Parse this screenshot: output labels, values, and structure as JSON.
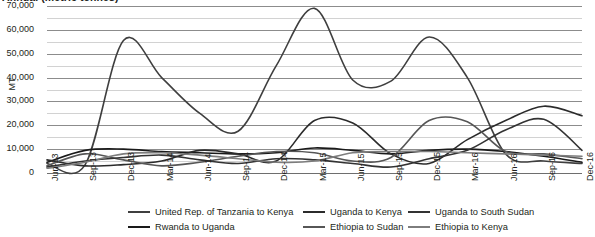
{
  "chart_data": {
    "type": "line",
    "title": "Annual (metric tonnes)",
    "xlabel": "",
    "ylabel": "MT",
    "ylim": [
      0,
      70000
    ],
    "ytick_labels": [
      "0",
      "10,000",
      "20,000",
      "30,000",
      "40,000",
      "50,000",
      "60,000",
      "70,000"
    ],
    "ytick_values": [
      0,
      10000,
      20000,
      30000,
      40000,
      50000,
      60000,
      70000
    ],
    "grid": "horizontal major and minor (5,000 step)",
    "legend_position": "bottom",
    "categories": [
      "Jun-13",
      "Sep-13",
      "Dec-13",
      "Mar-14",
      "Jun-14",
      "Sep-14",
      "Dec-14",
      "Mar-15",
      "Jun-15",
      "Sep-15",
      "Dec-15",
      "Mar-16",
      "Jun-16",
      "Sep-16",
      "Dec-16"
    ],
    "series": [
      {
        "name": "United Rep. of Tanzania to Kenya",
        "color": "#3f3f3f",
        "values": [
          4000,
          3500,
          55500,
          40000,
          25000,
          17500,
          45000,
          69000,
          39000,
          38500,
          57000,
          40000,
          8000,
          5000,
          4000
        ]
      },
      {
        "name": "Rwanda to Uganda",
        "color": "#1a1a1a",
        "values": [
          4500,
          9500,
          10000,
          9000,
          8500,
          8000,
          8500,
          10500,
          9500,
          8000,
          9500,
          10000,
          9000,
          7000,
          4500
        ]
      },
      {
        "name": "Uganda to Kenya",
        "color": "#2b2b2b",
        "values": [
          5500,
          3000,
          3500,
          5000,
          9500,
          8000,
          5000,
          22000,
          21000,
          8000,
          4000,
          14000,
          22000,
          28000,
          24000
        ]
      },
      {
        "name": "Ethiopia to Sudan",
        "color": "#565656",
        "values": [
          3000,
          8000,
          5500,
          3000,
          4500,
          7000,
          9000,
          8500,
          5000,
          6500,
          22000,
          21500,
          9000,
          8000,
          6000
        ]
      },
      {
        "name": "Uganda to South Sudan",
        "color": "#333333",
        "values": [
          2500,
          5000,
          6500,
          7500,
          5500,
          4000,
          6000,
          5500,
          4000,
          2500,
          6000,
          9500,
          18000,
          22500,
          9500
        ]
      },
      {
        "name": "Ethiopia to Kenya",
        "color": "#7d7d7d",
        "values": [
          2000,
          4500,
          8000,
          8500,
          7500,
          6000,
          4500,
          5000,
          8500,
          9000,
          9000,
          8500,
          8000,
          7500,
          7000
        ]
      }
    ]
  },
  "legend": {
    "items": [
      {
        "label": "United Rep. of Tanzania to Kenya"
      },
      {
        "label": "Rwanda to Uganda"
      },
      {
        "label": "Uganda to Kenya"
      },
      {
        "label": "Ethiopia to Sudan"
      },
      {
        "label": "Uganda to South Sudan"
      },
      {
        "label": "Ethiopia to Kenya"
      }
    ]
  }
}
